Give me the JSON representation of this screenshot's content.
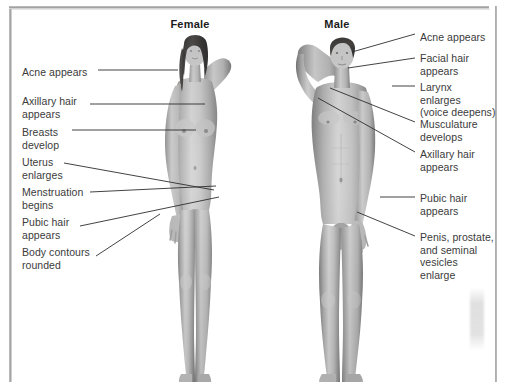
{
  "page": {
    "background_color": "#ffffff",
    "frame_color": "#9d9d9d",
    "text_color": "#3b3b3b",
    "heading_color": "#1b1b1b",
    "width": 511,
    "height": 382
  },
  "columns": [
    {
      "id": "female",
      "label": "Female",
      "center_x": 190,
      "y": 18
    },
    {
      "id": "male",
      "label": "Male",
      "center_x": 337,
      "y": 18
    }
  ],
  "female_labels": [
    {
      "id": "acne",
      "text": "Acne appears",
      "x": 22,
      "y": 66,
      "lines": 1
    },
    {
      "id": "axillary",
      "text": "Axillary hair\nappears",
      "x": 22,
      "y": 95,
      "lines": 2
    },
    {
      "id": "breasts",
      "text": "Breasts\ndevelop",
      "x": 22,
      "y": 126,
      "lines": 2
    },
    {
      "id": "uterus",
      "text": "Uterus\nenlarges",
      "x": 22,
      "y": 156,
      "lines": 2
    },
    {
      "id": "menstruation",
      "text": "Menstruation\nbegins",
      "x": 22,
      "y": 186,
      "lines": 2
    },
    {
      "id": "pubic",
      "text": "Pubic hair\nappears",
      "x": 22,
      "y": 216,
      "lines": 2
    },
    {
      "id": "contours",
      "text": "Body contours\nrounded",
      "x": 22,
      "y": 246,
      "lines": 2
    }
  ],
  "male_labels": [
    {
      "id": "acne",
      "text": "Acne appears",
      "x": 420,
      "y": 31,
      "lines": 1
    },
    {
      "id": "facial",
      "text": "Facial hair\nappears",
      "x": 420,
      "y": 52,
      "lines": 2
    },
    {
      "id": "larynx",
      "text": "Larynx\nenlarges\n(voice deepens)",
      "x": 420,
      "y": 81,
      "lines": 3
    },
    {
      "id": "musculature",
      "text": "Musculature\ndevelops",
      "x": 420,
      "y": 118,
      "lines": 2
    },
    {
      "id": "axillary",
      "text": "Axillary hair\nappears",
      "x": 420,
      "y": 148,
      "lines": 2
    },
    {
      "id": "pubic",
      "text": "Pubic hair\nappears",
      "x": 420,
      "y": 192,
      "lines": 2
    },
    {
      "id": "genitals",
      "text": "Penis, prostate,\nand seminal\nvesicles\nenlarge",
      "x": 420,
      "y": 231,
      "lines": 4
    }
  ],
  "female_leaders": [
    {
      "id": "acne",
      "x1": 98,
      "y1": 70,
      "x2": 178,
      "y2": 70
    },
    {
      "id": "axillary",
      "x1": 90,
      "y1": 104,
      "x2": 205,
      "y2": 104
    },
    {
      "id": "breasts",
      "x1": 72,
      "y1": 130,
      "x2": 196,
      "y2": 130
    },
    {
      "id": "uterus",
      "x1": 64,
      "y1": 163,
      "x2": 214,
      "y2": 190
    },
    {
      "id": "menstruation",
      "x1": 90,
      "y1": 192,
      "x2": 216,
      "y2": 186
    },
    {
      "id": "pubic",
      "x1": 80,
      "y1": 226,
      "x2": 219,
      "y2": 197
    },
    {
      "id": "contours",
      "x1": 96,
      "y1": 256,
      "x2": 160,
      "y2": 214
    }
  ],
  "male_leaders": [
    {
      "id": "acne",
      "x1": 415,
      "y1": 34,
      "x2": 352,
      "y2": 52
    },
    {
      "id": "facial",
      "x1": 415,
      "y1": 58,
      "x2": 348,
      "y2": 68
    },
    {
      "id": "larynx",
      "x1": 415,
      "y1": 86,
      "x2": 392,
      "y2": 86
    },
    {
      "id": "musculature",
      "x1": 415,
      "y1": 122,
      "x2": 330,
      "y2": 88
    },
    {
      "id": "axillary",
      "x1": 415,
      "y1": 152,
      "x2": 318,
      "y2": 98
    },
    {
      "id": "pubic",
      "x1": 415,
      "y1": 197,
      "x2": 380,
      "y2": 197
    },
    {
      "id": "genitals",
      "x1": 415,
      "y1": 236,
      "x2": 357,
      "y2": 212
    }
  ],
  "figures": [
    {
      "id": "female-figure",
      "alt": "female-body-illustration",
      "x": 148,
      "y": 24,
      "width": 94,
      "height": 358
    },
    {
      "id": "male-figure",
      "alt": "male-body-illustration",
      "x": 288,
      "y": 22,
      "width": 106,
      "height": 360
    }
  ],
  "leader_line_color": "#2e2e2e"
}
